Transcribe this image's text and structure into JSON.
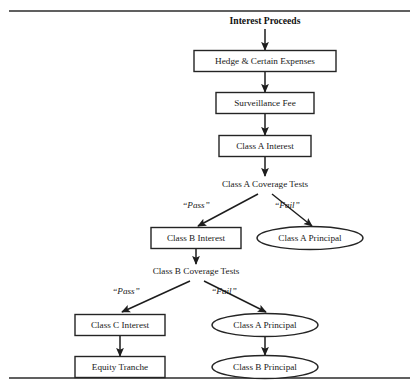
{
  "figure": {
    "title_node": "Interest Proceeds",
    "rules": {
      "top_y": 11,
      "bottom_y": 378,
      "x_start": 9,
      "x_end": 410
    }
  },
  "nodes": [
    {
      "id": "interest-proceeds",
      "label": "Interest Proceeds",
      "shape": "text-bold",
      "cx": 265,
      "cy": 21,
      "w": 96,
      "h": 14
    },
    {
      "id": "hedge-certain-expenses",
      "label": "Hedge & Certain Expenses",
      "shape": "box",
      "cx": 265,
      "cy": 61,
      "w": 142,
      "h": 21
    },
    {
      "id": "surveillance-fee",
      "label": "Surveillance Fee",
      "shape": "box",
      "cx": 265,
      "cy": 103,
      "w": 98,
      "h": 21
    },
    {
      "id": "class-a-interest",
      "label": "Class A Interest",
      "shape": "box",
      "cx": 265,
      "cy": 146,
      "w": 92,
      "h": 21
    },
    {
      "id": "class-a-coverage-tests",
      "label": "Class A Coverage Tests",
      "shape": "text",
      "cx": 265,
      "cy": 184,
      "w": 112,
      "h": 14
    },
    {
      "id": "class-b-interest",
      "label": "Class B Interest",
      "shape": "box",
      "cx": 196,
      "cy": 238,
      "w": 90,
      "h": 21
    },
    {
      "id": "class-a-principal-1",
      "label": "Class A Principal",
      "shape": "ellipse",
      "cx": 310,
      "cy": 238,
      "w": 106,
      "h": 23
    },
    {
      "id": "class-b-coverage-tests",
      "label": "Class B Coverage Tests",
      "shape": "text",
      "cx": 196,
      "cy": 271,
      "w": 112,
      "h": 14
    },
    {
      "id": "class-c-interest",
      "label": "Class C Interest",
      "shape": "box",
      "cx": 120,
      "cy": 325,
      "w": 90,
      "h": 21
    },
    {
      "id": "class-a-principal-2",
      "label": "Class A Principal",
      "shape": "ellipse",
      "cx": 265,
      "cy": 325,
      "w": 106,
      "h": 23
    },
    {
      "id": "equity-tranche",
      "label": "Equity Tranche",
      "shape": "box",
      "cx": 120,
      "cy": 367,
      "w": 90,
      "h": 21
    },
    {
      "id": "class-b-principal",
      "label": "Class B Principal",
      "shape": "ellipse",
      "cx": 265,
      "cy": 367,
      "w": 106,
      "h": 23
    }
  ],
  "edges": [
    {
      "id": "e-proceeds-hedge",
      "from": "interest-proceeds",
      "to": "hedge-certain-expenses",
      "label": "",
      "x1": 265,
      "y1": 29,
      "x2": 265,
      "y2": 50
    },
    {
      "id": "e-hedge-surveillance",
      "from": "hedge-certain-expenses",
      "to": "surveillance-fee",
      "label": "",
      "x1": 265,
      "y1": 72,
      "x2": 265,
      "y2": 92
    },
    {
      "id": "e-surveillance-classa",
      "from": "surveillance-fee",
      "to": "class-a-interest",
      "label": "",
      "x1": 265,
      "y1": 114,
      "x2": 265,
      "y2": 135
    },
    {
      "id": "e-classa-coverage",
      "from": "class-a-interest",
      "to": "class-a-coverage-tests",
      "label": "",
      "x1": 265,
      "y1": 157,
      "x2": 265,
      "y2": 176
    },
    {
      "id": "e-covA-pass",
      "from": "class-a-coverage-tests",
      "to": "class-b-interest",
      "label": "“Pass”",
      "x1": 258,
      "y1": 194,
      "x2": 198,
      "y2": 226,
      "label_x": 196,
      "label_y": 206
    },
    {
      "id": "e-covA-fail",
      "from": "class-a-coverage-tests",
      "to": "class-a-principal-1",
      "label": "“Fail”",
      "x1": 272,
      "y1": 194,
      "x2": 312,
      "y2": 226,
      "label_x": 287,
      "label_y": 206
    },
    {
      "id": "e-classb-coverage",
      "from": "class-b-interest",
      "to": "class-b-coverage-tests",
      "label": "",
      "x1": 196,
      "y1": 249,
      "x2": 196,
      "y2": 264
    },
    {
      "id": "e-covB-pass",
      "from": "class-b-coverage-tests",
      "to": "class-c-interest",
      "label": "“Pass”",
      "x1": 190,
      "y1": 281,
      "x2": 122,
      "y2": 312,
      "label_x": 126,
      "label_y": 292
    },
    {
      "id": "e-covB-fail",
      "from": "class-b-coverage-tests",
      "to": "class-a-principal-2",
      "label": "“Fail”",
      "x1": 204,
      "y1": 281,
      "x2": 266,
      "y2": 312,
      "label_x": 224,
      "label_y": 292
    },
    {
      "id": "e-classc-equity",
      "from": "class-c-interest",
      "to": "equity-tranche",
      "label": "",
      "x1": 120,
      "y1": 336,
      "x2": 120,
      "y2": 356
    },
    {
      "id": "e-principalA-principalB",
      "from": "class-a-principal-2",
      "to": "class-b-principal",
      "label": "",
      "x1": 265,
      "y1": 337,
      "x2": 265,
      "y2": 355
    }
  ],
  "colors": {
    "stroke": "#242424",
    "text": "#1a1a1a",
    "background": "#ffffff",
    "rule": "#2b2b2b"
  }
}
